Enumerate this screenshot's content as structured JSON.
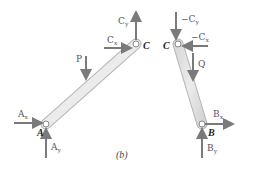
{
  "figure": {
    "caption": "(b)",
    "colors": {
      "arrow": "#7a7a7a",
      "member_fill": "#e3e3e3",
      "member_stroke": "#b5b5b5",
      "label": "#555555",
      "point_label": "#222222"
    }
  },
  "member_AC": {
    "points": {
      "A": "A",
      "C": "C"
    },
    "forces": {
      "Ax": "A",
      "Ax_sub": "x",
      "Ay": "A",
      "Ay_sub": "y",
      "Cx": "C",
      "Cx_sub": "x",
      "Cy": "C",
      "Cy_sub": "y",
      "P": "P"
    }
  },
  "member_CB": {
    "points": {
      "C": "C",
      "B": "B"
    },
    "forces": {
      "negCx": "−C",
      "negCx_sub": "x",
      "negCy": "−C",
      "negCy_sub": "y",
      "Bx": "B",
      "Bx_sub": "x",
      "By": "B",
      "By_sub": "y",
      "Q": "Q"
    }
  }
}
